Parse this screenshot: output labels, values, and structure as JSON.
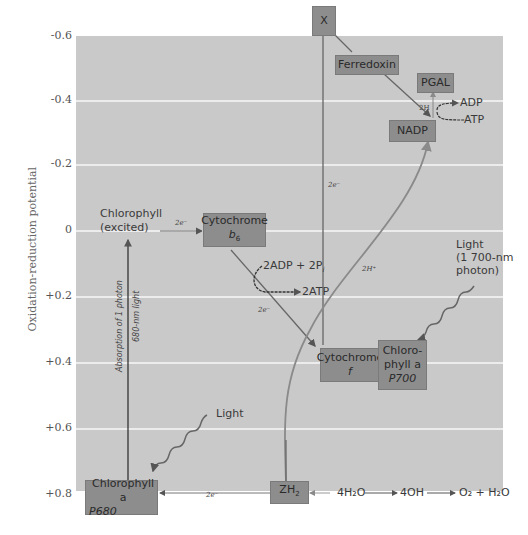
{
  "diagram": {
    "y_axis": {
      "label": "Oxidation-reduction potential",
      "ticks": [
        "-0.6",
        "-0.4",
        "-0.2",
        "0",
        "+0.2",
        "+0.4",
        "+0.6",
        "+0.8"
      ]
    },
    "nodes": {
      "x": "X",
      "ferredoxin": "Ferredoxin",
      "pgal": "PGAL",
      "nadp": "NADP",
      "cytochrome_b6_line1": "Cytochrome",
      "cytochrome_b6_line2": "b",
      "cytochrome_b6_sub": "6",
      "cytochrome_f_line1": "Cytochrome",
      "cytochrome_f_line2": "f",
      "p700_line1": "Chloro-",
      "p700_line2": "phyll a",
      "p700_line3": "P700",
      "p680_line1": "Chlorophyll a",
      "p680_line2": "P680",
      "zh2_main": "ZH",
      "zh2_sub": "2"
    },
    "labels": {
      "chlorophyll_excited_1": "Chlorophyll",
      "chlorophyll_excited_2": "(excited)",
      "e_b6": "2e⁻",
      "e_vertical": "2e⁻",
      "e_cyt_f": "2e⁻",
      "e_p680": "2e⁻",
      "h_plus": "2H⁺",
      "two_h": "2H",
      "adp": "ADP",
      "atp": "ATP",
      "adp_2pi": "2ADP + 2P",
      "adp_2pi_sub": "i",
      "two_atp": "2ATP",
      "light_top_1": "Light",
      "light_top_2": "(1 700-nm",
      "light_top_3": "photon)",
      "light_bottom": "Light",
      "absorption": "Absorption of 1 photon",
      "wavelength": "680-nm light",
      "water": "4H₂O",
      "hydroxide": "4OH",
      "products": "O₂ + H₂O"
    },
    "colors": {
      "panel": "#c9c9c9",
      "box": "#8d8d8d",
      "arrow_dark": "#555555",
      "arrow_light": "#8a8a8a"
    }
  }
}
